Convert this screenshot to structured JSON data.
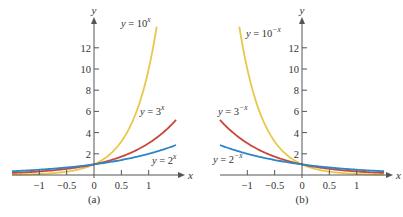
{
  "chart_data": [
    {
      "type": "line",
      "panel_label": "(a)",
      "title": "",
      "xlabel": "x",
      "ylabel": "y",
      "xlim": [
        -1.5,
        1.5
      ],
      "ylim": [
        0,
        14
      ],
      "x_ticks": [
        -1,
        -0.5,
        0,
        0.5,
        1
      ],
      "x_tick_labels": [
        "−1",
        "−0.5",
        "0",
        "0.5",
        "1"
      ],
      "y_ticks": [
        2,
        4,
        6,
        8,
        10,
        12
      ],
      "y_tick_labels": [
        "2",
        "4",
        "6",
        "8",
        "10",
        "12"
      ],
      "grid": false,
      "series": [
        {
          "name": "y = 10^x",
          "label_base": "y = 10",
          "label_exp": "x",
          "base": 10,
          "sign": 1,
          "color": "#e8c84a",
          "x_range": [
            -1.5,
            1.146
          ]
        },
        {
          "name": "y = 3^x",
          "label_base": "y = 3",
          "label_exp": "x",
          "base": 3,
          "sign": 1,
          "color": "#c9473a",
          "x_range": [
            -1.5,
            1.5
          ]
        },
        {
          "name": "y = 2^x",
          "label_base": "y = 2",
          "label_exp": "x",
          "base": 2,
          "sign": 1,
          "color": "#2e86c8",
          "x_range": [
            -1.5,
            1.5
          ]
        }
      ]
    },
    {
      "type": "line",
      "panel_label": "(b)",
      "title": "",
      "xlabel": "x",
      "ylabel": "y",
      "xlim": [
        -1.5,
        1.5
      ],
      "ylim": [
        0,
        14
      ],
      "x_ticks": [
        -1,
        -0.5,
        0,
        0.5,
        1
      ],
      "x_tick_labels": [
        "−1",
        "−0.5",
        "0",
        "0.5",
        "1"
      ],
      "y_ticks": [
        2,
        4,
        6,
        8,
        10,
        12
      ],
      "y_tick_labels": [
        "2",
        "4",
        "6",
        "8",
        "10",
        "12"
      ],
      "grid": false,
      "series": [
        {
          "name": "y = 10^-x",
          "label_base": "y = 10",
          "label_exp": "−x",
          "base": 10,
          "sign": -1,
          "color": "#e8c84a",
          "x_range": [
            -1.146,
            1.5
          ]
        },
        {
          "name": "y = 3^-x",
          "label_base": "y = 3",
          "label_exp": "−x",
          "base": 3,
          "sign": -1,
          "color": "#c9473a",
          "x_range": [
            -1.5,
            1.5
          ]
        },
        {
          "name": "y = 2^-x",
          "label_base": "y = 2",
          "label_exp": "−x",
          "base": 2,
          "sign": -1,
          "color": "#2e86c8",
          "x_range": [
            -1.5,
            1.5
          ]
        }
      ]
    }
  ],
  "layout": {
    "panels": [
      {
        "origin": [
          94,
          175
        ],
        "x_axis_px": [
          12,
          180
        ],
        "y_axis_top_px": 22,
        "px_per_x": 54.7,
        "px_per_y": 10.6,
        "curve_labels": [
          {
            "x": 121,
            "y": 27
          },
          {
            "x": 140,
            "y": 115
          },
          {
            "x": 152,
            "y": 164
          }
        ],
        "panel_label_pos": [
          94,
          203
        ]
      },
      {
        "origin": [
          302,
          175
        ],
        "x_axis_px": [
          220,
          388
        ],
        "y_axis_top_px": 22,
        "px_per_x": 54.7,
        "px_per_y": 10.6,
        "curve_labels": [
          {
            "x": 246,
            "y": 37
          },
          {
            "x": 218,
            "y": 115
          },
          {
            "x": 213,
            "y": 163
          }
        ],
        "panel_label_pos": [
          302,
          203
        ]
      }
    ],
    "axis_color": "#555555"
  }
}
